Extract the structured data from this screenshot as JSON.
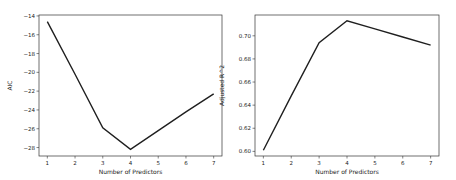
{
  "chart_data": [
    {
      "type": "line",
      "title": "",
      "xlabel": "Number of Predictors",
      "ylabel": "AIC",
      "x": [
        1,
        2,
        3,
        4,
        5,
        6,
        7
      ],
      "values": [
        -14.6,
        -20.2,
        -25.9,
        -28.2,
        -26.2,
        -24.2,
        -22.3
      ],
      "xticks": [
        "1",
        "2",
        "3",
        "4",
        "5",
        "6",
        "7"
      ],
      "yticks": [
        "-14",
        "-16",
        "-18",
        "-20",
        "-22",
        "-24",
        "-26",
        "-28"
      ],
      "ylim": [
        -28.9,
        -13.9
      ],
      "grid": false,
      "line_color": "#1f1f1f"
    },
    {
      "type": "line",
      "title": "",
      "xlabel": "Number of Predictors",
      "ylabel": "Adjusted R^2",
      "x": [
        1,
        2,
        3,
        4,
        5,
        6,
        7
      ],
      "values": [
        0.601,
        0.648,
        0.694,
        0.713,
        0.706,
        0.699,
        0.692
      ],
      "xticks": [
        "1",
        "2",
        "3",
        "4",
        "5",
        "6",
        "7"
      ],
      "yticks": [
        "0.60",
        "0.62",
        "0.64",
        "0.66",
        "0.68",
        "0.70"
      ],
      "ylim": [
        0.596,
        0.718
      ],
      "grid": false,
      "line_color": "#1f1f1f"
    }
  ]
}
